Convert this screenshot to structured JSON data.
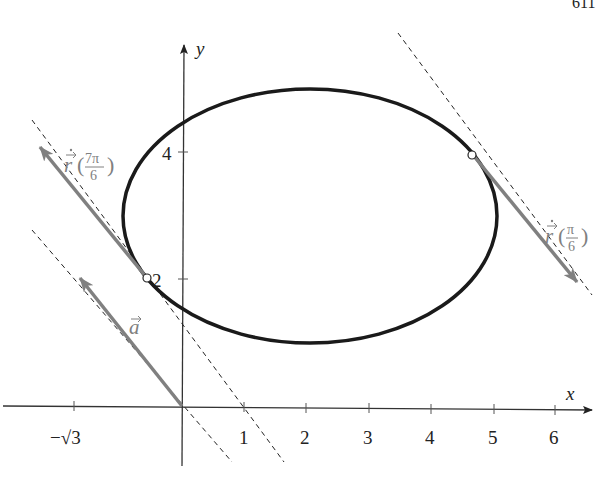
{
  "page_number": "611",
  "axes": {
    "x_label": "x",
    "y_label": "y",
    "x_ticks": [
      {
        "label": "−√3",
        "px": 74
      },
      {
        "label": "1",
        "px": 244
      },
      {
        "label": "2",
        "px": 306
      },
      {
        "label": "3",
        "px": 369
      },
      {
        "label": "4",
        "px": 431
      },
      {
        "label": "5",
        "px": 494
      },
      {
        "label": "6",
        "px": 555
      }
    ],
    "y_ticks": [
      {
        "label": "2",
        "px": 279
      },
      {
        "label": "4",
        "px": 152
      }
    ]
  },
  "curve": {
    "type": "ellipse",
    "center": [
      2,
      3
    ],
    "rx_units": 3,
    "ry_units": 2,
    "color": "#1a1a1a"
  },
  "vectors": {
    "a": {
      "label": "a",
      "from": [
        0,
        0
      ],
      "to": [
        -1.73,
        2
      ],
      "color": "#808080"
    },
    "r_dot_7pi6": {
      "label_prefix": "r",
      "arg_num": "7π",
      "arg_den": "6",
      "from": [
        -0.6,
        2
      ],
      "to": [
        -2.3,
        4.1
      ],
      "color": "#808080"
    },
    "r_dot_pi6": {
      "label_prefix": "r",
      "arg_num": "π",
      "arg_den": "6",
      "from": [
        4.6,
        4
      ],
      "to": [
        6.3,
        1.95
      ],
      "color": "#808080"
    }
  },
  "points": [
    {
      "name": "point-7pi6",
      "coords": [
        -0.6,
        2
      ]
    },
    {
      "name": "point-pi6",
      "coords": [
        4.6,
        4
      ]
    }
  ],
  "colors": {
    "axis": "#333333",
    "vector": "#808080",
    "curve": "#1a1a1a",
    "dashed": "#222222"
  }
}
